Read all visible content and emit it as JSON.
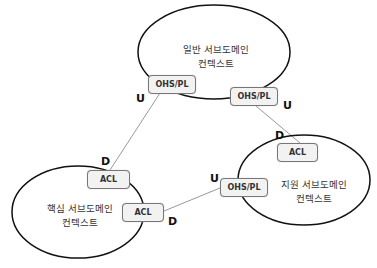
{
  "contexts": {
    "generic": {
      "line1": "일반 서브도메인",
      "line2": "컨텍스트"
    },
    "core": {
      "line1": "핵심 서브도메인",
      "line2": "컨텍스트"
    },
    "supporting": {
      "line1": "지원 서브도메인",
      "line2": "컨텍스트"
    }
  },
  "boxes": {
    "generic_left": "OHS/PL",
    "generic_right": "OHS/PL",
    "core_top": "ACL",
    "core_right": "ACL",
    "supporting_top": "ACL",
    "supporting_left": "OHS/PL"
  },
  "markers": {
    "generic_left_u": "U",
    "generic_right_u": "U",
    "core_top_d": "D",
    "core_right_d": "D",
    "supporting_top_d": "D",
    "supporting_left_u": "U"
  },
  "colors": {
    "stroke": "#111111",
    "line": "#888888",
    "box_fill": "#f2f2f2"
  }
}
